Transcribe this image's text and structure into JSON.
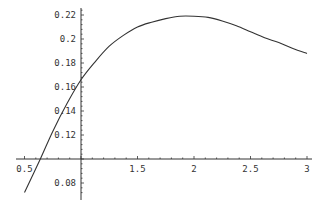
{
  "chart_data": {
    "type": "line",
    "title": "",
    "xlabel": "",
    "ylabel": "",
    "xlim": [
      0.5,
      3.0
    ],
    "ylim": [
      0.07,
      0.225
    ],
    "axes_origin": {
      "x": 1.0,
      "y": 0.1
    },
    "grid": false,
    "legend": null,
    "x_ticks": [
      {
        "value": 0.5,
        "label": "0.5"
      },
      {
        "value": 1.5,
        "label": "1.5"
      },
      {
        "value": 2.0,
        "label": "2"
      },
      {
        "value": 2.5,
        "label": "2.5"
      },
      {
        "value": 3.0,
        "label": "3"
      }
    ],
    "y_ticks": [
      {
        "value": 0.08,
        "label": "0.08"
      },
      {
        "value": 0.12,
        "label": "0.12"
      },
      {
        "value": 0.14,
        "label": "0.14"
      },
      {
        "value": 0.16,
        "label": "0.16"
      },
      {
        "value": 0.18,
        "label": "0.18"
      },
      {
        "value": 0.2,
        "label": "0.2"
      },
      {
        "value": 0.22,
        "label": "0.22"
      }
    ],
    "series": [
      {
        "name": "f(x)",
        "color": "#333333",
        "x": [
          0.5,
          0.64,
          0.75,
          0.875,
          1.0,
          1.125,
          1.25,
          1.375,
          1.5,
          1.625,
          1.75,
          1.875,
          2.0,
          2.125,
          2.25,
          2.375,
          2.5,
          2.625,
          2.75,
          2.875,
          3.0
        ],
        "y": [
          0.072,
          0.1,
          0.123,
          0.146,
          0.166,
          0.181,
          0.194,
          0.203,
          0.21,
          0.214,
          0.217,
          0.219,
          0.219,
          0.218,
          0.215,
          0.211,
          0.206,
          0.201,
          0.197,
          0.192,
          0.188
        ]
      }
    ]
  }
}
